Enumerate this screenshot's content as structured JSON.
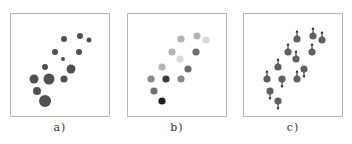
{
  "points": [
    {
      "x": 53,
      "y": 25
    },
    {
      "x": 69,
      "y": 22
    },
    {
      "x": 78,
      "y": 26
    },
    {
      "x": 44,
      "y": 38
    },
    {
      "x": 68,
      "y": 38
    },
    {
      "x": 52,
      "y": 45
    },
    {
      "x": 34,
      "y": 53
    },
    {
      "x": 60,
      "y": 55
    },
    {
      "x": 23,
      "y": 65
    },
    {
      "x": 38,
      "y": 65
    },
    {
      "x": 53,
      "y": 65
    },
    {
      "x": 26,
      "y": 77
    },
    {
      "x": 34,
      "y": 87
    }
  ],
  "panels": [
    {
      "id": "a",
      "caption": "a)",
      "encoding": "size",
      "color": "#505050",
      "sizes": [
        3,
        3,
        2.5,
        3,
        3,
        2,
        3,
        4.5,
        4.5,
        5.5,
        3.5,
        4,
        6
      ]
    },
    {
      "id": "b",
      "caption": "b)",
      "encoding": "gray-value",
      "grays": [
        "#b4b4b4",
        "#b4b4b4",
        "#d8d8d8",
        "#b4b4b4",
        "#6e6e6e",
        "#d8d8d8",
        "#b4b4b4",
        "#6e6e6e",
        "#8a8a8a",
        "#3c3c3c",
        "#8a8a8a",
        "#6e6e6e",
        "#1e1e1e"
      ]
    },
    {
      "id": "c",
      "caption": "c)",
      "encoding": "arrow-direction",
      "color": "#606060",
      "arrows": [
        "up",
        "up",
        "up",
        "up",
        "up",
        "up",
        "up",
        "down",
        "up",
        "down",
        "up",
        "down",
        "down"
      ]
    }
  ]
}
